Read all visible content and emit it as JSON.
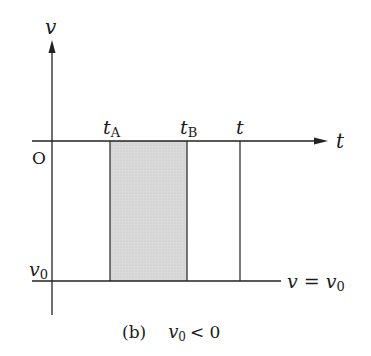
{
  "diagram": {
    "axes": {
      "y_label": "v",
      "x_label": "t",
      "origin_label": "O"
    },
    "markers": {
      "tA": {
        "base": "t",
        "sub": "A"
      },
      "tB": {
        "base": "t",
        "sub": "B"
      },
      "t": {
        "base": "t"
      }
    },
    "v0_label": {
      "base": "v",
      "sub": "0"
    },
    "line_label": {
      "lhs": "v",
      "eq": "=",
      "rhs_base": "v",
      "rhs_sub": "0"
    },
    "caption": {
      "tag": "(b)",
      "cond_base": "v",
      "cond_sub": "0",
      "cond_rest": "< 0"
    },
    "colors": {
      "line": "#222222",
      "shade": "#d9d9d9"
    }
  }
}
